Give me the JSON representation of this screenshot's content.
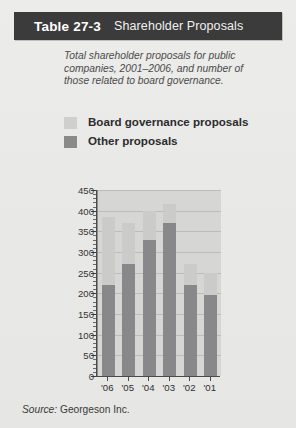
{
  "header": {
    "table_number": "Table 27-3",
    "title": "Shareholder Proposals"
  },
  "caption": "Total shareholder proposals for public companies, 2001–2006, and number of those related to board governance.",
  "legend": {
    "items": [
      {
        "label": "Board governance proposals",
        "color": "#cbcbc9",
        "swatch": "light"
      },
      {
        "label": "Other proposals",
        "color": "#88888a",
        "swatch": "dark"
      }
    ]
  },
  "source": {
    "prefix": "Source:",
    "text": "Georgeson Inc."
  },
  "colors": {
    "header_bg": "#3b3b3b",
    "page_bg": "#e8e8e6",
    "plot_bg": "#d6d6d4",
    "board_governance": "#cbcbc9",
    "other_proposals": "#88888a",
    "gridline": "#bcbcba",
    "axis": "#4a4a48"
  },
  "chart_data": {
    "type": "bar",
    "subtype": "stacked",
    "title": "Shareholder Proposals",
    "xlabel": "",
    "ylabel": "",
    "categories": [
      "'06",
      "'05",
      "'04",
      "'03",
      "'02",
      "'01"
    ],
    "series": [
      {
        "name": "Other proposals",
        "color": "#88888a",
        "values": [
          220,
          270,
          330,
          370,
          220,
          195
        ]
      },
      {
        "name": "Board governance proposals",
        "color": "#cbcbc9",
        "values": [
          165,
          100,
          70,
          45,
          50,
          55
        ]
      }
    ],
    "totals": [
      385,
      370,
      400,
      415,
      270,
      250
    ],
    "ylim": [
      0,
      450
    ],
    "ytick_step": 50,
    "yticks": [
      0,
      50,
      100,
      150,
      200,
      250,
      300,
      350,
      400,
      450
    ],
    "ytick_labels": [
      "0",
      "50",
      "100",
      "150",
      "200",
      "250",
      "300",
      "350",
      "400",
      "450"
    ],
    "minor_tick_step": 10,
    "grid": true,
    "grid_axis": "y",
    "legend_position": "above-plot"
  }
}
